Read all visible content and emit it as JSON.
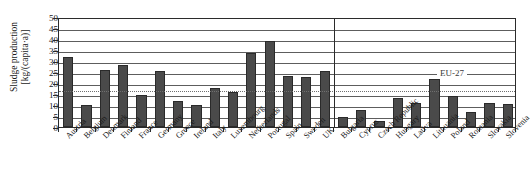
{
  "chart_data": {
    "type": "bar",
    "title": "",
    "subtitle": "",
    "xlabel": "",
    "ylabel": "Sludge production [kg/(capita·a)]",
    "ylabel_line1": "Sludge production",
    "ylabel_line2": "[kg/(capita·a)]",
    "ylim": [
      0,
      50
    ],
    "ytick_step": 5,
    "yticks": [
      0,
      5,
      10,
      15,
      20,
      25,
      30,
      35,
      40,
      45,
      50
    ],
    "grid": true,
    "grid_axis": "y",
    "legend": "none",
    "bar_color": "#4a4a4a",
    "categories": [
      "Austria",
      "Belgium",
      "Denmark",
      "Finland",
      "France",
      "Germany",
      "Greece",
      "Ireland",
      "Italy",
      "Luxembourg",
      "Netherlands",
      "Portugal",
      "Spain",
      "Sweden",
      "UK",
      "Bulgaria",
      "Cyprus",
      "Czech Republic",
      "Hungary",
      "Lativa",
      "Lithuania",
      "Poland",
      "Romania",
      "Slovakia",
      "Slovenia"
    ],
    "values": [
      31.8,
      10.2,
      25.7,
      28.0,
      14.4,
      25.6,
      11.7,
      10.2,
      17.9,
      16.0,
      33.7,
      39.0,
      23.3,
      22.9,
      25.6,
      4.5,
      7.6,
      2.6,
      13.4,
      11.1,
      22.0,
      14.1,
      7.0,
      11.0,
      10.3
    ],
    "annotations": [
      {
        "name": "eu27-reference-line",
        "label": "EU-27",
        "value": 17.2,
        "style": "dotted",
        "orientation": "horizontal"
      },
      {
        "name": "group-divider",
        "label": "",
        "after_category": "UK",
        "orientation": "vertical"
      }
    ],
    "groups": [
      {
        "name": "EU-15",
        "start": 0,
        "end": 14
      },
      {
        "name": "New member states",
        "start": 15,
        "end": 24
      }
    ]
  }
}
